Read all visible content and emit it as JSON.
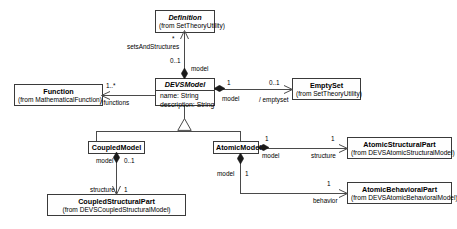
{
  "diagram": {
    "type": "uml-class-diagram",
    "stroke_color": "#4a4a4a",
    "background_color": "#ffffff"
  },
  "classes": [
    {
      "id": "definition",
      "name": "Definition",
      "package": "(from SetTheoryUtility)",
      "abstract": true,
      "attributes": []
    },
    {
      "id": "devsmodel",
      "name": "DEVSModel",
      "package": "",
      "abstract": true,
      "attributes": [
        "name: String",
        "description: String"
      ]
    },
    {
      "id": "function",
      "name": "Function",
      "package": "(from MathematicalFunction)",
      "abstract": false,
      "attributes": []
    },
    {
      "id": "emptyset",
      "name": "EmptySet",
      "package": "(from SetTheoryUtility)",
      "abstract": false,
      "attributes": []
    },
    {
      "id": "coupledmodel",
      "name": "CoupledModel",
      "package": "",
      "abstract": false,
      "attributes": []
    },
    {
      "id": "atomicmodel",
      "name": "AtomicModel",
      "package": "",
      "abstract": false,
      "attributes": []
    },
    {
      "id": "coupledstructuralpart",
      "name": "CoupledStructuralPart",
      "package": "(from DEVSCoupledStructuralModel)",
      "abstract": false,
      "attributes": []
    },
    {
      "id": "atomicstructuralpart",
      "name": "AtomicStructuralPart",
      "package": "(from DEVSAtomicStructuralModel)",
      "abstract": false,
      "attributes": []
    },
    {
      "id": "atomicbehavioralpart",
      "name": "AtomicBehavioralPart",
      "package": "(from DEVSAtomicBehavioralModel)",
      "abstract": false,
      "attributes": []
    }
  ],
  "relationships": [
    {
      "id": "devsmodel-definition",
      "from": "devsmodel",
      "to": "definition",
      "kind": "composition",
      "source_multiplicity": "0..1",
      "source_role": "model",
      "target_multiplicity": "*",
      "target_role": "setsAndStructures"
    },
    {
      "id": "devsmodel-function",
      "from": "devsmodel",
      "to": "function",
      "kind": "association",
      "target_multiplicity": "1..*",
      "target_role": "/ functions"
    },
    {
      "id": "devsmodel-emptyset",
      "from": "devsmodel",
      "to": "emptyset",
      "kind": "composition",
      "source_multiplicity": "1",
      "source_role": "model",
      "target_multiplicity": "0..1",
      "target_role": "/ emptyset"
    },
    {
      "id": "coupledmodel-devsmodel",
      "from": "coupledmodel",
      "to": "devsmodel",
      "kind": "generalization"
    },
    {
      "id": "atomicmodel-devsmodel",
      "from": "atomicmodel",
      "to": "devsmodel",
      "kind": "generalization"
    },
    {
      "id": "coupledmodel-coupledstructuralpart",
      "from": "coupledmodel",
      "to": "coupledstructuralpart",
      "kind": "composition",
      "source_multiplicity": "0..1",
      "source_role": "model",
      "target_multiplicity": "1",
      "target_role": "structure"
    },
    {
      "id": "atomicmodel-atomicstructuralpart",
      "from": "atomicmodel",
      "to": "atomicstructuralpart",
      "kind": "composition",
      "source_multiplicity": "1",
      "source_role": "model",
      "target_multiplicity": "1",
      "target_role": "structure"
    },
    {
      "id": "atomicmodel-atomicbehavioralpart",
      "from": "atomicmodel",
      "to": "atomicbehavioralpart",
      "kind": "composition",
      "source_multiplicity": "1",
      "source_role": "model",
      "target_multiplicity": "1",
      "target_role": "behavior"
    }
  ],
  "labels": {
    "star": "*",
    "setsAndStructures": "setsAndStructures",
    "zero_one_a": "0..1",
    "model_top": "model",
    "one_dot_star": "1..*",
    "slash_functions": "/ functions",
    "one_emptyset_src": "1",
    "model_emptyset": "model",
    "zero_one_emptyset": "0..1",
    "slash_emptyset": "/ emptyset",
    "model_coupled": "model",
    "zero_one_coupled": "0..1",
    "structure_coupled": "structure",
    "one_coupled_target": "1",
    "one_atomic_struct_src": "1",
    "model_atomic_struct": "model",
    "one_atomic_struct_target": "1",
    "structure_atomic": "structure",
    "model_atomic_behav": "model",
    "one_atomic_behav_src": "1",
    "one_atomic_behav_target": "1",
    "behavior_atomic": "behavior"
  }
}
